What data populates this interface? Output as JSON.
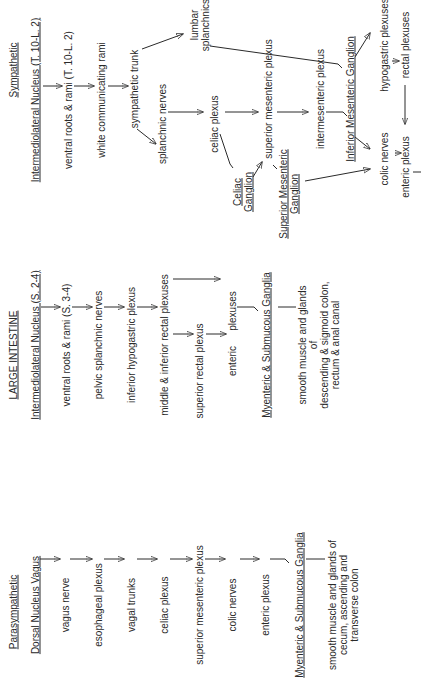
{
  "diagram": {
    "orientation": "rotated 90 degrees counter-clockwise",
    "parasympathetic": {
      "heading": "Parasympathetic",
      "nucleus": "Dorsal Nucleus Vagus",
      "chain": [
        "vagus nerve",
        "esophageal plexus",
        "vagal trunks",
        "celiac plexus",
        "superior mesenteric plexus",
        "colic nerves",
        "enteric plexus"
      ],
      "ganglia": "Myenteric & Submucous Ganglia",
      "target_lines": [
        "smooth muscle and glands of",
        "cecum,  ascending and",
        "transverse colon"
      ]
    },
    "large_intestine": {
      "heading": "LARGE INTESTINE",
      "nucleus": "Intermediolateral Nucleus (S. 2-4)",
      "chain": [
        "ventral roots & rami (S. 3-4)",
        "pelvic splanchnic nerves",
        "inferior hypogastric plexus",
        "middle & inferior rectal plexuses"
      ],
      "branch": "superior rectal plexus",
      "enteric": "enteric",
      "plexuses": "plexuses",
      "ganglia": "Myenteric & Submucous Ganglia",
      "target_lines": [
        "smooth muscle and glands",
        "of",
        "descending & sigmoid colon,",
        "rectum & anal canal"
      ]
    },
    "sympathetic": {
      "heading": "Sympathetic",
      "nucleus": "Intermediolateral Nucleus (T. 10-L. 2)",
      "ventral_roots": "ventral roots & rami (T. 10-L. 2)",
      "white_rami": "white communicating rami",
      "trunk": "sympathetic trunk",
      "lumbar_lines": [
        "lumbar",
        "splanchnics"
      ],
      "splanchnic": "splanchnic nerves",
      "celiac_plexus": "celiac plexus",
      "sup_mes_plexus": "superior mesenteric plexus",
      "intermesenteric": "intermesenteric plexus",
      "inf_mes_ganglion": "Inferior Mesenteric Ganglion",
      "hypogastric": "hypogastric plexuses",
      "rectal": "rectal plexuses",
      "celiac_ganglion_lines": [
        "Celiac",
        "Ganglion"
      ],
      "sup_mes_ganglion_lines": [
        "Superior Mesenteric",
        "Ganglion"
      ],
      "colic": "colic nerves",
      "enteric": "enteric plexus"
    }
  }
}
